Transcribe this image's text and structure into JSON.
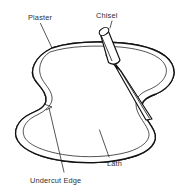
{
  "figure": {
    "background_color": "#ffffff",
    "line_color": "#111111",
    "text_color": "#2e2e2e",
    "width": 185,
    "height": 190,
    "labels": [
      {
        "id": "plaster",
        "text": "Plaster",
        "x": 28,
        "y": 20,
        "anchor": "start",
        "leader": "M40.5,23.5 L52,48"
      },
      {
        "id": "chisel",
        "text": "Chisel",
        "x": 96,
        "y": 18,
        "anchor": "start",
        "leader": "M112,21 L112,28"
      },
      {
        "id": "undercut-edge",
        "text": "Undercut Edge",
        "x": 30,
        "y": 183,
        "anchor": "start",
        "leader": "M49,108 L64,172"
      },
      {
        "id": "lath",
        "text": "Lath",
        "x": 107,
        "y": 166,
        "anchor": "start",
        "leader": "M99.5,130 L109,157"
      }
    ],
    "lath_bands": [
      {
        "id": "band-1",
        "hatch_count": 16
      },
      {
        "id": "band-2",
        "hatch_count": 18
      },
      {
        "id": "band-3",
        "hatch_count": 20
      },
      {
        "id": "band-4",
        "hatch_count": 22
      },
      {
        "id": "band-5",
        "hatch_count": 22
      },
      {
        "id": "band-6",
        "hatch_count": 20
      },
      {
        "id": "band-7",
        "hatch_count": 18
      },
      {
        "id": "band-8",
        "hatch_count": 14
      }
    ],
    "chisel": {
      "handle_label": "handle",
      "ferrule_label": "ferrule",
      "blade_label": "blade",
      "tip_x": 152,
      "tip_y": 119
    }
  }
}
